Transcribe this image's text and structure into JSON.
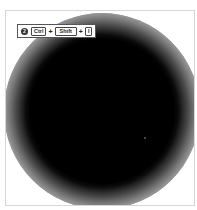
{
  "shortcut": {
    "step_number": "2",
    "keys": [
      "Ctrl",
      "Shift",
      "I"
    ],
    "separator": "+"
  },
  "colors": {
    "blob": "#000000",
    "frame_border": "#d6d6d6",
    "background": "#ffffff"
  }
}
